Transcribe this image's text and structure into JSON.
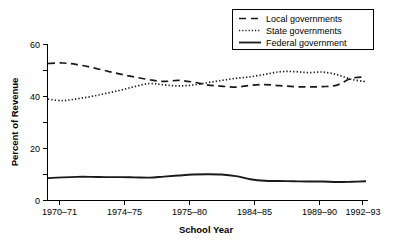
{
  "chart_data": {
    "type": "line",
    "title": "",
    "xlabel": "School Year",
    "ylabel": "Percent of Revenue",
    "grid": false,
    "legend_position": "top-right",
    "ylim": [
      0,
      60
    ],
    "yticks": [
      0,
      20,
      40,
      60
    ],
    "ytick_labels": [
      "0",
      "20",
      "40",
      "60"
    ],
    "categories": [
      "1970–71",
      "1974–75",
      "1975–80",
      "1984–85",
      "1989–90",
      "1992–93"
    ],
    "xtick_labels": [
      "1970–71",
      "1974–75",
      "1975–80",
      "1984–85",
      "1989–90",
      "1992–93"
    ],
    "series": [
      {
        "name": "Local governments",
        "style": "dashed",
        "color": "#1a1a1a",
        "x": [
          0,
          1,
          2,
          3,
          4,
          5,
          6,
          7,
          8,
          9,
          10,
          11,
          12,
          13,
          14,
          15,
          16,
          17,
          18,
          19,
          20,
          21,
          22
        ],
        "values": [
          52.5,
          52.7,
          52.1,
          51.0,
          49.7,
          48.4,
          47.3,
          46.3,
          45.6,
          46.0,
          45.4,
          44.3,
          43.8,
          43.4,
          44.1,
          44.4,
          44.0,
          43.6,
          43.5,
          43.6,
          44.2,
          46.8,
          47.3
        ]
      },
      {
        "name": "State governments",
        "style": "dotted",
        "color": "#1a1a1a",
        "x": [
          0,
          1,
          2,
          3,
          4,
          5,
          6,
          7,
          8,
          9,
          10,
          11,
          12,
          13,
          14,
          15,
          16,
          17,
          18,
          19,
          20,
          21,
          22
        ],
        "values": [
          38.8,
          38.2,
          38.9,
          39.8,
          41.0,
          42.2,
          43.6,
          44.8,
          44.3,
          43.9,
          44.2,
          45.1,
          46.0,
          46.8,
          47.4,
          48.3,
          49.3,
          49.4,
          49.0,
          49.2,
          48.2,
          46.4,
          45.5
        ]
      },
      {
        "name": "Federal government",
        "style": "solid",
        "color": "#1a1a1a",
        "x": [
          0,
          1,
          2,
          3,
          4,
          5,
          6,
          7,
          8,
          9,
          10,
          11,
          12,
          13,
          14,
          15,
          16,
          17,
          18,
          19,
          20,
          21,
          22
        ],
        "values": [
          8.4,
          8.7,
          8.9,
          8.9,
          8.8,
          8.8,
          8.7,
          8.6,
          9.0,
          9.4,
          9.8,
          9.9,
          9.8,
          9.2,
          8.0,
          7.4,
          7.3,
          7.2,
          7.1,
          7.1,
          6.9,
          7.0,
          7.2
        ]
      }
    ]
  },
  "legend": {
    "items": [
      {
        "label": "Local governments",
        "style": "dashed"
      },
      {
        "label": "State governments",
        "style": "dotted"
      },
      {
        "label": "Federal government",
        "style": "solid"
      }
    ]
  },
  "axes": {
    "y_title": "Percent of Revenue",
    "x_title": "School Year"
  }
}
